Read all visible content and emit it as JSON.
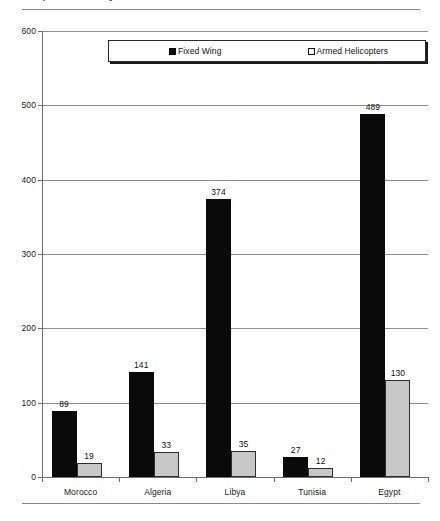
{
  "page": {
    "title_fragment": "Comparative Military Aircraft Inventories of North African States",
    "rules": {
      "top": true,
      "bottom": true
    }
  },
  "legend": {
    "entries": [
      {
        "label": "Fixed Wing",
        "swatch": "filled-square-marker",
        "color": "#0a0a0a"
      },
      {
        "label": "Armed Helicopters",
        "swatch": "outlined-square-marker",
        "color": "#c8c8c8"
      }
    ]
  },
  "chart_data": {
    "type": "bar",
    "title": "",
    "xlabel": "",
    "ylabel": "",
    "categories": [
      "Morocco",
      "Algeria",
      "Libya",
      "Tunisia",
      "Egypt"
    ],
    "series": [
      {
        "name": "Fixed Wing",
        "color": "#0a0a0a",
        "values": [
          89,
          141,
          374,
          27,
          489
        ]
      },
      {
        "name": "Armed Helicopters",
        "color": "#c8c8c8",
        "values": [
          19,
          33,
          35,
          12,
          130
        ]
      }
    ],
    "ylim": [
      0,
      600
    ],
    "yticks": [
      0,
      100,
      200,
      300,
      400,
      500,
      600
    ],
    "ytick_labels": [
      "0",
      "100",
      "200",
      "300",
      "400",
      "500",
      "600"
    ],
    "grid": true,
    "grid_axis": "y",
    "legend_position": "top-center",
    "data_labels": true
  }
}
